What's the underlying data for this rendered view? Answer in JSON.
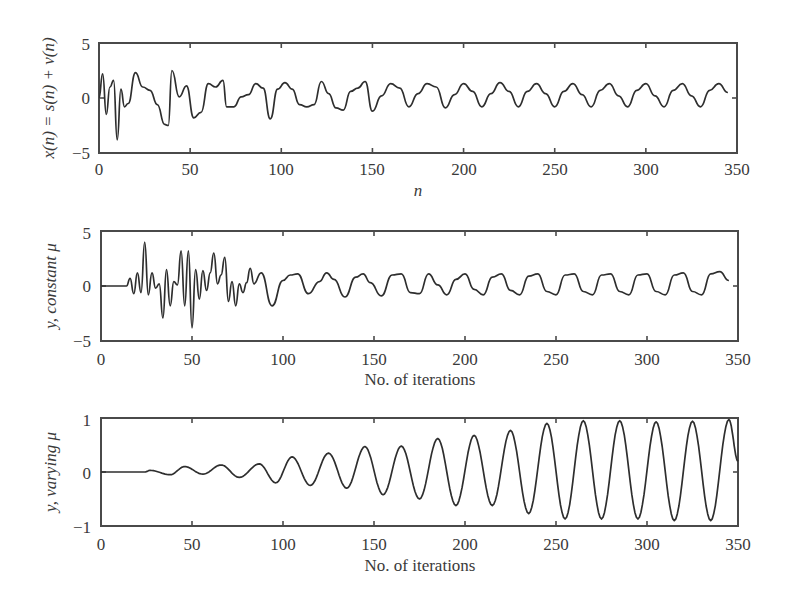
{
  "chart_data": [
    {
      "type": "line",
      "title": "",
      "xlabel": "n",
      "ylabel": "x(n) = s(n) + v(n)",
      "xlim": [
        0,
        350
      ],
      "ylim": [
        -5,
        5
      ],
      "xticks": [
        "0",
        "50",
        "100",
        "150",
        "200",
        "250",
        "300",
        "350"
      ],
      "yticks": [
        "5",
        "0",
        "−5"
      ],
      "grid": false,
      "legend": null,
      "description": "Noisy sinusoid; strong noise for n<100 (peaks ~2.5, dips ~-3.8 near n=10), gradually becoming a clean sinusoid of amplitude ~1 with period ~20 for n>150",
      "series": [
        {
          "name": "x(n)",
          "x": [
            0,
            2,
            4,
            6,
            8,
            10,
            12,
            14,
            16,
            20,
            24,
            28,
            32,
            36,
            38,
            40,
            44,
            48,
            52,
            56,
            60,
            64,
            68,
            70,
            74,
            78,
            82,
            86,
            90,
            94,
            98,
            102,
            106,
            110,
            114,
            118,
            122,
            126,
            130,
            134,
            138,
            142,
            146,
            150,
            155,
            160,
            165,
            170,
            175,
            180,
            185,
            190,
            195,
            200,
            205,
            210,
            215,
            220,
            225,
            230,
            235,
            240,
            245,
            250,
            255,
            260,
            265,
            270,
            275,
            280,
            285,
            290,
            295,
            300,
            305,
            310,
            315,
            320,
            325,
            330,
            335,
            340,
            345,
            350
          ],
          "values": [
            0,
            2.2,
            -1.5,
            1.0,
            1.6,
            -3.8,
            0.8,
            -0.8,
            -0.5,
            2.3,
            1.0,
            0.7,
            -0.6,
            -2.4,
            -2.5,
            2.5,
            0.1,
            1.1,
            -1.8,
            -1.3,
            1.3,
            1.0,
            1.6,
            -0.8,
            -0.8,
            0.1,
            0.3,
            1.3,
            0.9,
            -1.9,
            0.8,
            1.4,
            0.8,
            -0.6,
            -0.8,
            -0.6,
            1.5,
            0.4,
            -0.9,
            -1.1,
            0.6,
            0.9,
            1.5,
            -1.2,
            0.2,
            1.3,
            0.9,
            -0.8,
            0.4,
            1.3,
            1.0,
            -0.9,
            0.3,
            1.3,
            0.6,
            -0.8,
            0.4,
            1.4,
            0.6,
            -0.8,
            0.6,
            1.3,
            0.4,
            -0.8,
            0.6,
            1.3,
            0.3,
            -0.8,
            0.7,
            1.3,
            0.2,
            -0.8,
            0.7,
            1.3,
            0.2,
            -0.8,
            0.7,
            1.3,
            0.2,
            -0.8,
            0.7,
            1.3,
            0.5
          ]
        }
      ]
    },
    {
      "type": "line",
      "title": "",
      "xlabel": "No. of iterations",
      "ylabel": "y, constant μ",
      "xlim": [
        0,
        350
      ],
      "ylim": [
        -5,
        5
      ],
      "xticks": [
        "0",
        "50",
        "100",
        "150",
        "200",
        "250",
        "300",
        "350"
      ],
      "yticks": [
        "5",
        "0",
        "−5"
      ],
      "grid": false,
      "legend": null,
      "description": "Zero until ~n=15, large erratic transients up to ~4 and down to ~-4 between n=20 and n=85, then settles to a sinusoid of amplitude ~1.1, period ~20",
      "series": [
        {
          "name": "y (constant mu)",
          "x": [
            0,
            14,
            16,
            18,
            20,
            22,
            24,
            26,
            28,
            30,
            32,
            34,
            36,
            38,
            40,
            42,
            44,
            46,
            48,
            50,
            52,
            54,
            56,
            58,
            60,
            62,
            64,
            66,
            68,
            70,
            72,
            74,
            76,
            78,
            80,
            82,
            84,
            88,
            94,
            100,
            104,
            108,
            114,
            120,
            124,
            128,
            134,
            140,
            144,
            148,
            154,
            160,
            165,
            170,
            175,
            180,
            185,
            190,
            195,
            200,
            205,
            210,
            215,
            220,
            225,
            230,
            235,
            240,
            245,
            250,
            255,
            260,
            265,
            270,
            275,
            280,
            285,
            290,
            295,
            300,
            305,
            310,
            315,
            320,
            325,
            330,
            335,
            340,
            345,
            350
          ],
          "values": [
            0,
            0,
            0.7,
            -0.7,
            1.2,
            -0.6,
            4.0,
            -0.8,
            1.2,
            -0.2,
            0.2,
            -2.9,
            1.5,
            -1.8,
            0.4,
            0.1,
            3.2,
            -1.8,
            3.2,
            -3.8,
            1.5,
            -1.2,
            1.4,
            -0.4,
            1.2,
            3.0,
            0.2,
            1.0,
            2.6,
            -1.4,
            0.4,
            -1.8,
            0.2,
            -0.6,
            0.3,
            1.6,
            0.2,
            1.2,
            -1.8,
            0.5,
            1.0,
            1.1,
            -0.7,
            0.4,
            1.2,
            0.6,
            -1.0,
            0.8,
            1.1,
            0.3,
            -0.9,
            1.0,
            1.1,
            -0.6,
            -0.7,
            1.1,
            0.1,
            -0.8,
            0.6,
            1.1,
            -0.3,
            -0.8,
            0.8,
            1.1,
            -0.4,
            -0.8,
            0.9,
            1.1,
            -0.5,
            -0.8,
            1.0,
            1.1,
            -0.5,
            -0.8,
            1.0,
            1.1,
            -0.5,
            -0.8,
            1.0,
            1.1,
            -0.5,
            -0.8,
            1.0,
            1.2,
            -0.5,
            -0.8,
            1.1,
            1.3,
            0.5
          ]
        }
      ]
    },
    {
      "type": "line",
      "title": "",
      "xlabel": "No. of iterations",
      "ylabel": "y, varying μ",
      "xlim": [
        0,
        350
      ],
      "ylim": [
        -1,
        1
      ],
      "xticks": [
        "0",
        "50",
        "100",
        "150",
        "200",
        "250",
        "300",
        "350"
      ],
      "yticks": [
        "1",
        "0",
        "−1"
      ],
      "grid": false,
      "legend": null,
      "description": "Zero until ~n=24, then a sinusoid (period ~20) whose amplitude grows from ~0.05 to ~0.95 by n≈260 and stays near full amplitude",
      "series": [
        {
          "name": "y (varying mu)",
          "peaks": [
            {
              "x": 27,
              "y": 0.03
            },
            {
              "x": 38,
              "y": -0.05
            },
            {
              "x": 46,
              "y": 0.1
            },
            {
              "x": 56,
              "y": -0.04
            },
            {
              "x": 66,
              "y": 0.13
            },
            {
              "x": 76,
              "y": -0.1
            },
            {
              "x": 87,
              "y": 0.15
            },
            {
              "x": 96,
              "y": -0.2
            },
            {
              "x": 105,
              "y": 0.28
            },
            {
              "x": 115,
              "y": -0.25
            },
            {
              "x": 125,
              "y": 0.35
            },
            {
              "x": 135,
              "y": -0.3
            },
            {
              "x": 145,
              "y": 0.47
            },
            {
              "x": 155,
              "y": -0.42
            },
            {
              "x": 165,
              "y": 0.48
            },
            {
              "x": 175,
              "y": -0.5
            },
            {
              "x": 185,
              "y": 0.62
            },
            {
              "x": 195,
              "y": -0.62
            },
            {
              "x": 205,
              "y": 0.68
            },
            {
              "x": 215,
              "y": -0.62
            },
            {
              "x": 225,
              "y": 0.77
            },
            {
              "x": 235,
              "y": -0.77
            },
            {
              "x": 245,
              "y": 0.9
            },
            {
              "x": 255,
              "y": -0.87
            },
            {
              "x": 265,
              "y": 0.95
            },
            {
              "x": 275,
              "y": -0.87
            },
            {
              "x": 285,
              "y": 0.95
            },
            {
              "x": 295,
              "y": -0.87
            },
            {
              "x": 305,
              "y": 0.93
            },
            {
              "x": 315,
              "y": -0.9
            },
            {
              "x": 325,
              "y": 0.94
            },
            {
              "x": 335,
              "y": -0.9
            },
            {
              "x": 345,
              "y": 0.97
            },
            {
              "x": 350,
              "y": 0.2
            }
          ]
        }
      ]
    }
  ],
  "plots": [
    {
      "ylabel": "x(n) = s(n) + v(n)",
      "xlabel": "n",
      "yticks": [
        "5",
        "0",
        "−5"
      ],
      "xticks": [
        "0",
        "50",
        "100",
        "150",
        "200",
        "250",
        "300",
        "350"
      ]
    },
    {
      "ylabel": "y, constant μ",
      "xlabel": "No. of iterations",
      "yticks": [
        "5",
        "0",
        "−5"
      ],
      "xticks": [
        "0",
        "50",
        "100",
        "150",
        "200",
        "250",
        "300",
        "350"
      ]
    },
    {
      "ylabel": "y, varying μ",
      "xlabel": "No. of iterations",
      "yticks": [
        "1",
        "0",
        "−1"
      ],
      "xticks": [
        "0",
        "50",
        "100",
        "150",
        "200",
        "250",
        "300",
        "350"
      ]
    }
  ]
}
